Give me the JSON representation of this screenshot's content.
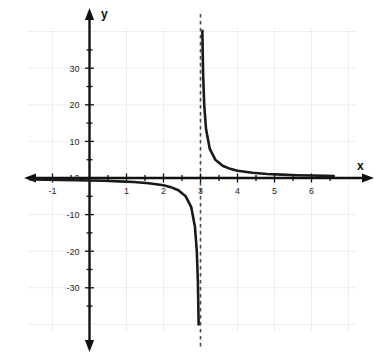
{
  "chart_data": {
    "type": "line",
    "title": "",
    "subtitle": "",
    "xlabel": "x",
    "ylabel": "y",
    "xlim": [
      -1.6,
      6.6
    ],
    "ylim": [
      -36,
      36
    ],
    "grid": true,
    "grid_color": "#ededf1",
    "legend": false,
    "legend_position": "none",
    "curve_color": "#1a1a1a",
    "axis_color": "#111111",
    "asymptote_color": "#444444",
    "x_ticks_major": [
      -1,
      1,
      2,
      3,
      4,
      5,
      6
    ],
    "x_tick_labels": [
      "-1",
      "1",
      "2",
      "3",
      "4",
      "5",
      "6"
    ],
    "x_minor_step": 0.5,
    "y_ticks_major": [
      -30,
      -20,
      -10,
      0,
      10,
      20,
      30
    ],
    "y_tick_labels": [
      "-30",
      "-20",
      "-10",
      "0",
      "10",
      "20",
      "30"
    ],
    "y_minor_step": 5,
    "annotations": [
      {
        "name": "vertical-asymptote",
        "kind": "vertical-dashed-line",
        "x": 3,
        "label": "x = 3"
      }
    ],
    "series": [
      {
        "name": "left-branch",
        "equation": "y = -2/(x-3)",
        "x": [
          -1.6,
          -1.2,
          -0.8,
          -0.4,
          0.0,
          0.4,
          0.8,
          1.2,
          1.6,
          2.0,
          2.2,
          2.4,
          2.6,
          2.75,
          2.85,
          2.9,
          2.93,
          2.95
        ],
        "y": [
          -0.43,
          -0.48,
          -0.53,
          -0.59,
          -0.67,
          -0.77,
          -0.91,
          -1.11,
          -1.43,
          -2.0,
          -2.5,
          -3.33,
          -5.0,
          -8.0,
          -13.3,
          -20.0,
          -28.6,
          -40.0
        ]
      },
      {
        "name": "right-branch",
        "equation": "y = -2/(x-3)",
        "x": [
          3.05,
          3.07,
          3.1,
          3.15,
          3.25,
          3.4,
          3.6,
          3.8,
          4.0,
          4.4,
          4.8,
          5.2,
          5.6,
          6.0,
          6.4,
          6.6
        ],
        "y": [
          40.0,
          28.6,
          20.0,
          13.3,
          8.0,
          5.0,
          3.33,
          2.5,
          2.0,
          1.43,
          1.11,
          0.91,
          0.77,
          0.67,
          0.59,
          0.56
        ]
      }
    ]
  },
  "axes": {
    "x_axis_name": "x",
    "y_axis_name": "y"
  }
}
